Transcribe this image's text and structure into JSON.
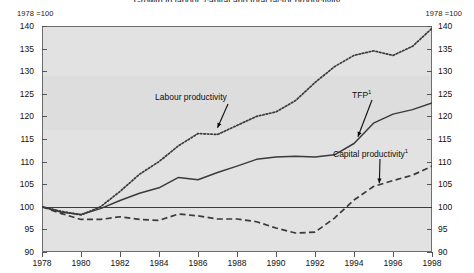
{
  "title": "Growth in labour, capital and total factor productivity",
  "axis_notes": {
    "left": "1978 =100",
    "right": "1978 =100"
  },
  "colors": {
    "plot_background": "#e2e2e2",
    "frame": "#6e6e6e",
    "series_line": "#3a3a3a",
    "text": "#111111"
  },
  "chart_data": {
    "type": "line",
    "title": "Growth in labour, capital and total factor productivity",
    "xlabel": "",
    "ylabel": "1978 =100",
    "xlim": [
      1978,
      1998
    ],
    "ylim": [
      90,
      140
    ],
    "yticks": [
      90,
      95,
      100,
      105,
      110,
      115,
      120,
      125,
      130,
      135,
      140
    ],
    "xticks": [
      1978,
      1980,
      1982,
      1984,
      1986,
      1988,
      1990,
      1992,
      1994,
      1996,
      1998
    ],
    "grid": false,
    "legend": "none (inline annotations with arrows)",
    "reference_line": 100,
    "x": [
      1978,
      1979,
      1980,
      1981,
      1982,
      1983,
      1984,
      1985,
      1986,
      1987,
      1988,
      1989,
      1990,
      1991,
      1992,
      1993,
      1994,
      1995,
      1996,
      1997,
      1998
    ],
    "series": [
      {
        "name": "Labour productivity",
        "style": "dotted",
        "values": [
          100.0,
          99.0,
          98.2,
          100.0,
          103.4,
          107.2,
          110.0,
          113.5,
          116.2,
          116.0,
          118.0,
          120.0,
          121.0,
          123.5,
          127.5,
          131.0,
          133.5,
          134.5,
          133.5,
          135.5,
          139.5
        ]
      },
      {
        "name": "TFP",
        "style": "solid",
        "superscript": "1",
        "values": [
          100.0,
          98.8,
          98.3,
          99.6,
          101.4,
          103.0,
          104.2,
          106.5,
          106.0,
          107.6,
          109.0,
          110.5,
          111.0,
          111.2,
          111.0,
          111.5,
          114.0,
          118.5,
          120.5,
          121.5,
          123.0
        ]
      },
      {
        "name": "Capital productivity",
        "style": "dashed",
        "superscript": "1",
        "values": [
          100.0,
          98.5,
          97.2,
          97.2,
          97.8,
          97.2,
          97.0,
          98.4,
          98.0,
          97.3,
          97.3,
          96.7,
          95.3,
          94.2,
          94.4,
          97.5,
          101.5,
          104.5,
          105.8,
          107.0,
          109.0
        ]
      }
    ],
    "annotations": [
      {
        "text": "Labour productivity",
        "target_x": 1987,
        "target_y": 117.5
      },
      {
        "text": "TFP",
        "superscript": "1",
        "target_x": 1994.2,
        "target_y": 115.5
      },
      {
        "text": "Capital productivity",
        "superscript": "1",
        "target_x": 1995.3,
        "target_y": 105.2
      }
    ]
  }
}
